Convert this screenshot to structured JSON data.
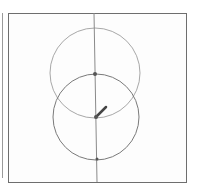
{
  "canvas": {
    "frame": {
      "x": 8,
      "y": 13,
      "width": 178,
      "height": 169
    },
    "colors": {
      "frame": "#6e6e6e",
      "upper_circle": "#a8a8a8",
      "lower_circle": "#7a7a7a",
      "axis_line": "#8a8a8a",
      "point": "#555555",
      "segment": "#444444"
    }
  },
  "shapes": {
    "axis_line": {
      "x1": 94,
      "y1": 13,
      "x2": 97,
      "y2": 182
    },
    "upper_circle": {
      "cx": 95,
      "cy": 73,
      "r": 45
    },
    "lower_circle": {
      "cx": 96,
      "cy": 117,
      "r": 43
    },
    "points": [
      {
        "name": "upper-point",
        "x": 95,
        "y": 74,
        "r": 2
      },
      {
        "name": "center-point",
        "x": 96,
        "y": 117,
        "r": 2
      },
      {
        "name": "bottom-point",
        "x": 97,
        "y": 159,
        "r": 1.5
      }
    ],
    "segment": {
      "x1": 96,
      "y1": 117,
      "x2": 106,
      "y2": 107
    }
  }
}
